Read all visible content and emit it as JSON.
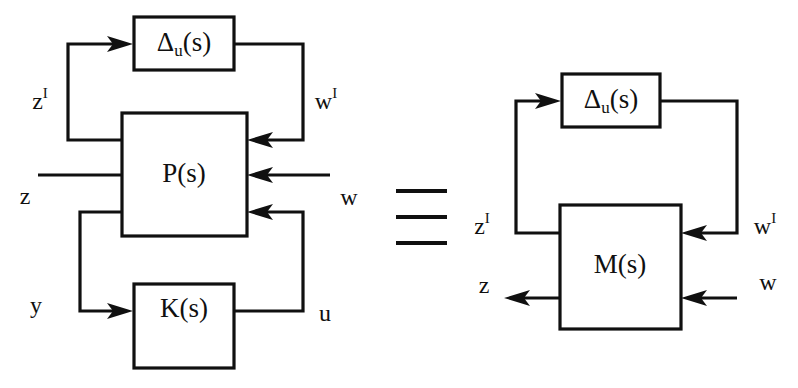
{
  "figure": {
    "type": "control-system-block-diagram",
    "relation_symbol": "≡",
    "relation_symbol_name": "identically-equal-triple-bar"
  },
  "left_diagram": {
    "name": "plant-controller-uncertainty-interconnection",
    "blocks": [
      {
        "id": "delta",
        "label": "Δ",
        "subscript": "u",
        "suffix": "(s)"
      },
      {
        "id": "plant",
        "label": "P(s)"
      },
      {
        "id": "controller",
        "label": "K(s)"
      }
    ],
    "signals": [
      {
        "id": "z-uncertainty",
        "base": "z",
        "superscript": "I"
      },
      {
        "id": "w-uncertainty",
        "base": "w",
        "superscript": "I"
      },
      {
        "id": "z-performance",
        "base": "z",
        "superscript": ""
      },
      {
        "id": "w-exogenous",
        "base": "w",
        "superscript": ""
      },
      {
        "id": "y-measurement",
        "base": "y",
        "superscript": ""
      },
      {
        "id": "u-control",
        "base": "u",
        "superscript": ""
      }
    ]
  },
  "right_diagram": {
    "name": "m-delta-closed-loop-form",
    "blocks": [
      {
        "id": "delta",
        "label": "Δ",
        "subscript": "u",
        "suffix": "(s)"
      },
      {
        "id": "closed-loop",
        "label": "M(s)"
      }
    ],
    "signals": [
      {
        "id": "z-uncertainty",
        "base": "z",
        "superscript": "I"
      },
      {
        "id": "w-uncertainty",
        "base": "w",
        "superscript": "I"
      },
      {
        "id": "z-performance",
        "base": "z",
        "superscript": ""
      },
      {
        "id": "w-exogenous",
        "base": "w",
        "superscript": ""
      }
    ]
  },
  "colors": {
    "ink": "#101010",
    "paper": "#ffffff"
  }
}
